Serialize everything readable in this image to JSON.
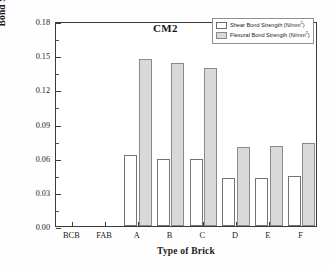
{
  "chart_data": {
    "type": "bar",
    "title": "",
    "annotation": "CM2",
    "xlabel": "Type of Brick",
    "ylabel": "Bond Strength (N/mm2)",
    "ylabel_base": "Bond Strength (N/mm",
    "ylabel_sup": "2",
    "ylabel_tail": ")",
    "categories": [
      "BCB",
      "FAB",
      "A",
      "B",
      "C",
      "D",
      "E",
      "F"
    ],
    "series": [
      {
        "name": "Shear Bond Strength (N/mm2)",
        "name_base": "Shear Bond Strength (N/mm",
        "name_sup": "2",
        "name_tail": ")",
        "style": "shear",
        "values": [
          0,
          0,
          0.062,
          0.059,
          0.059,
          0.042,
          0.042,
          0.044
        ]
      },
      {
        "name": "Flexural Bond Strength (N/mm2)",
        "name_base": "Flexural Bond Strength (N/mm",
        "name_sup": "2",
        "name_tail": ")",
        "style": "flexural",
        "values": [
          0,
          0,
          0.147,
          0.143,
          0.139,
          0.069,
          0.07,
          0.073
        ]
      }
    ],
    "ylim": [
      0.0,
      0.18
    ],
    "ytick_values": [
      0.0,
      0.03,
      0.06,
      0.09,
      0.12,
      0.15,
      0.18
    ],
    "ytick_labels": [
      "0.00",
      "0.03",
      "0.06",
      "0.09",
      "0.12",
      "0.15",
      "0.18"
    ],
    "yminor_values": [
      0.015,
      0.045,
      0.075,
      0.105,
      0.135,
      0.165
    ],
    "grid": false,
    "legend_position": "top-right",
    "colors": {
      "shear_fill": "#ffffff",
      "flexural_fill": "#d9d9d9",
      "bar_edge": "#6d6d6d",
      "axis": "#3a3a3a",
      "text": "#1a1a1a",
      "background": "#ffffff"
    }
  }
}
